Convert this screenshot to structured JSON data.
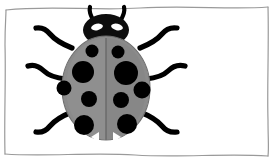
{
  "image": {
    "title": "Ladybug illustration",
    "width": 276,
    "height": 163,
    "background_color": "#ffffff"
  },
  "frame": {
    "name": "wavy-border",
    "stroke_color": "#9a9a9a",
    "stroke_width": 1.2,
    "inset": {
      "left": 6,
      "top": 7,
      "right": 268,
      "bottom": 156
    },
    "style": "hand-drawn wavy rectangle"
  },
  "subject": {
    "name": "ladybug",
    "label": "ladybug",
    "colors": {
      "body": "#8b8b8b",
      "body_shadow": "#7c7c7c",
      "body_highlight": "#9a9a9a",
      "spots": "#000000",
      "head": "#0d0d0d",
      "legs": "#000000",
      "eyes": "#ffffff",
      "outline": "#6f6f6f"
    },
    "body": {
      "name": "elytra",
      "center_x": 106,
      "center_y": 88,
      "radius_x": 44,
      "radius_y": 52
    },
    "wing_split": {
      "name": "elytra-seam",
      "x": 106,
      "y_top": 38,
      "y_bottom": 140
    },
    "head": {
      "name": "head",
      "center_x": 106,
      "center_y": 30,
      "radius_x": 23,
      "radius_y": 16
    },
    "eyes": [
      {
        "name": "left-eye",
        "cx": 97,
        "cy": 27,
        "rx": 6,
        "ry": 3.2,
        "rotate": -12
      },
      {
        "name": "right-eye",
        "cx": 117,
        "cy": 27,
        "rx": 6,
        "ry": 3.2,
        "rotate": 12
      }
    ],
    "antennae": [
      {
        "name": "left-antenna",
        "path": "M 94 22 C 90 14, 89 11, 90 7"
      },
      {
        "name": "right-antenna",
        "path": "M 120 22 C 124 14, 125 11, 124 7"
      }
    ],
    "spots": [
      {
        "name": "spot-upper-left-small",
        "cx": 92,
        "cy": 51,
        "r": 6.5
      },
      {
        "name": "spot-upper-right-small",
        "cx": 118,
        "cy": 52,
        "r": 6.5
      },
      {
        "name": "spot-mid-left-large",
        "cx": 83,
        "cy": 72,
        "r": 11
      },
      {
        "name": "spot-mid-right-large",
        "cx": 126,
        "cy": 73,
        "r": 12
      },
      {
        "name": "spot-outer-left",
        "cx": 64,
        "cy": 88,
        "r": 7.5
      },
      {
        "name": "spot-outer-right",
        "cx": 142,
        "cy": 90,
        "r": 8.5
      },
      {
        "name": "spot-center-left",
        "cx": 89,
        "cy": 99,
        "r": 8
      },
      {
        "name": "spot-center-right",
        "cx": 121,
        "cy": 100,
        "r": 8
      },
      {
        "name": "spot-lower-left",
        "cx": 84,
        "cy": 125,
        "r": 10
      },
      {
        "name": "spot-lower-right",
        "cx": 127,
        "cy": 124,
        "r": 10
      }
    ],
    "spot_count": 10,
    "notches": [
      {
        "name": "left-notch",
        "points": "91,137 99,132 99,142"
      },
      {
        "name": "right-notch",
        "points": "121,137 113,132 113,142"
      }
    ],
    "legs": [
      {
        "name": "front-left-leg",
        "path": "M 72 48 C 62 44, 55 40, 50 34 C 46 29, 42 27, 36 28"
      },
      {
        "name": "mid-left-leg",
        "path": "M 66 79 C 56 78, 49 76, 44 71 C 39 66, 34 64, 28 66"
      },
      {
        "name": "hind-left-leg",
        "path": "M 72 112 C 62 116, 55 120, 50 126 C 46 131, 42 133, 36 132"
      },
      {
        "name": "front-right-leg",
        "path": "M 140 48 C 150 44, 157 40, 162 34 C 166 29, 170 27, 177 28"
      },
      {
        "name": "mid-right-leg",
        "path": "M 146 79 C 156 78, 163 76, 168 71 C 173 66, 178 64, 185 66"
      },
      {
        "name": "hind-right-leg",
        "path": "M 140 112 C 150 116, 157 120, 162 126 C 166 131, 170 133, 177 132"
      }
    ]
  }
}
